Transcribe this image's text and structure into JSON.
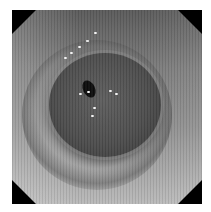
{
  "image": {
    "description": "Grayscale endoscopic view of a tubular lumen with concentric mucosal folds and small specular highlights",
    "colors": {
      "frame_corners": "#000000",
      "background": "#ffffff",
      "lumen_center": "#0c0c0c",
      "wall_light": "#b9b9b9",
      "wall_dark": "#4d4d4d"
    }
  }
}
